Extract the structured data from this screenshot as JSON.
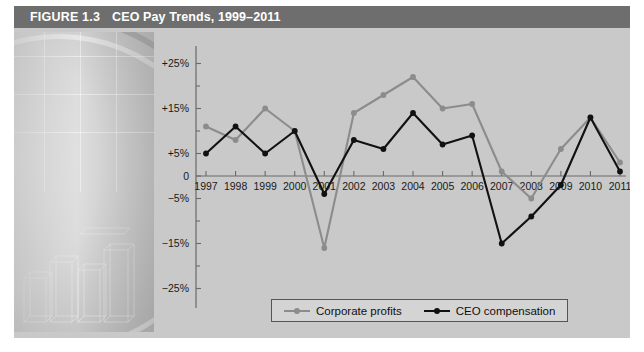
{
  "figure": {
    "number_label": "FIGURE 1.3",
    "title": "CEO Pay Trends, 1999–2011"
  },
  "legend": {
    "position": "bottom-center",
    "items": [
      {
        "label": "Corporate profits",
        "color": "#8c8c8c"
      },
      {
        "label": "CEO compensation",
        "color": "#111111"
      }
    ]
  },
  "colors": {
    "title_bar": "#6e6e6e",
    "panel": "#c9c9c9",
    "corporate_profits": "#8c8c8c",
    "ceo_compensation": "#111111",
    "axis": "#6a6a6a"
  },
  "chart_data": {
    "type": "line",
    "title": "CEO Pay Trends, 1999–2011",
    "xlabel": "",
    "ylabel": "",
    "grid": false,
    "legend_position": "bottom-center",
    "categories": [
      1997,
      1998,
      1999,
      2000,
      2001,
      2002,
      2003,
      2004,
      2005,
      2006,
      2007,
      2008,
      2009,
      2010,
      2011
    ],
    "x_tick_labels": [
      "1997",
      "1998",
      "1999",
      "2000",
      "2001",
      "2002",
      "2003",
      "2004",
      "2005",
      "2006",
      "2007",
      "2008",
      "2009",
      "2010",
      "2011"
    ],
    "y_tick_labels": [
      "+25%",
      "+15%",
      "+5%",
      "0",
      "−5%",
      "−15%",
      "−25%"
    ],
    "y_tick_values": [
      25,
      15,
      5,
      0,
      -5,
      -15,
      -25
    ],
    "y_minor_tick_values": [
      20,
      10,
      -10,
      -20
    ],
    "ylim": [
      -28,
      28
    ],
    "series": [
      {
        "name": "Corporate profits",
        "color": "#8c8c8c",
        "values": [
          11,
          8,
          15,
          10,
          -16,
          14,
          18,
          22,
          15,
          16,
          1,
          -5,
          6,
          13,
          3
        ]
      },
      {
        "name": "CEO compensation",
        "color": "#111111",
        "values": [
          5,
          11,
          5,
          10,
          -4,
          8,
          6,
          14,
          7,
          9,
          -15,
          -9,
          -2,
          13,
          1
        ]
      }
    ]
  }
}
